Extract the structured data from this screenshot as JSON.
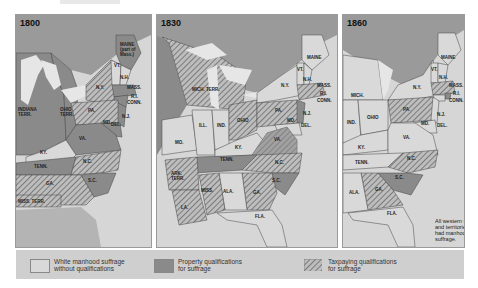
{
  "colors": {
    "ocean": "#d6d6d6",
    "lakes": "#e6e6e6",
    "canada": "#9a9a9a",
    "white_manhood": "#d9d9d9",
    "property": "#8a8a8a",
    "taxpaying_bg": "#bdbdbd",
    "taxpaying_hatch": "#6a6a6a",
    "unorganized": "#a8a8a8",
    "legend_bg": "#cfcfcf"
  },
  "maps": [
    {
      "year": "1800",
      "labels": {
        "maine": "MAINE (part of Mass.)",
        "vt": "VT.",
        "nh": "N.H.",
        "mass": "MASS.",
        "ri": "R.I.",
        "conn": "CONN.",
        "ny": "N.Y.",
        "pa": "PA.",
        "nj": "N.J.",
        "del": "DEL.",
        "md": "MD.",
        "va": "VA.",
        "nc": "N.C.",
        "sc": "S.C.",
        "ga": "GA.",
        "ky": "KY.",
        "tenn": "TENN.",
        "ohio_terr": "OHIO TERR.",
        "indiana_terr": "INDIANA TERR.",
        "miss_terr": "MISS. TERR."
      }
    },
    {
      "year": "1830",
      "labels": {
        "maine": "MAINE",
        "vt": "VT.",
        "nh": "N.H.",
        "mass": "MASS.",
        "ri": "R.I.",
        "conn": "CONN.",
        "ny": "N.Y.",
        "pa": "PA.",
        "nj": "N.J.",
        "del": "DEL.",
        "md": "MD.",
        "va": "VA.",
        "nc": "N.C.",
        "sc": "S.C.",
        "ga": "GA.",
        "ala": "ALA.",
        "miss": "MISS.",
        "la": "LA.",
        "ark_terr": "ARK. TERR.",
        "tenn": "TENN.",
        "ky": "KY.",
        "ohio": "OHIO",
        "ind": "IND.",
        "ill": "ILL.",
        "mo": "MO.",
        "mich_terr": "MICH. TERR.",
        "fla": "FLA."
      }
    },
    {
      "year": "1860",
      "labels": {
        "maine": "MAINE",
        "vt": "VT.",
        "nh": "N.H.",
        "mass": "MASS.",
        "ri": "R.I.",
        "conn": "CONN.",
        "ny": "N.Y.",
        "pa": "PA.",
        "nj": "N.J.",
        "del": "DEL.",
        "md": "MD.",
        "va": "VA.",
        "nc": "N.C.",
        "sc": "S.C.",
        "ga": "GA.",
        "ala": "ALA.",
        "tenn": "TENN.",
        "ky": "KY.",
        "ohio": "OHIO",
        "ind": "IND.",
        "mich": "MICH.",
        "fla": "FLA."
      },
      "note": "All western states and territories had manhood suffrage."
    }
  ],
  "legend": {
    "items": [
      {
        "label_line1": "White manhood suffrage",
        "label_line2": "without qualifications",
        "type": "white"
      },
      {
        "label_line1": "Property qualifications",
        "label_line2": "for suffrage",
        "type": "property"
      },
      {
        "label_line1": "Taxpaying qualifications",
        "label_line2": "for suffrage",
        "type": "taxpaying"
      }
    ]
  }
}
